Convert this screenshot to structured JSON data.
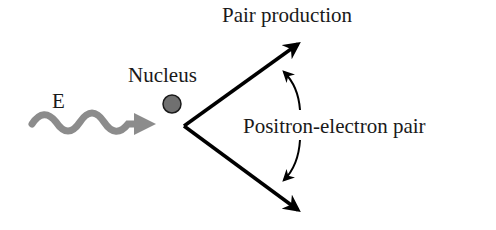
{
  "diagram": {
    "title": "Pair production",
    "labels": {
      "energy": "E",
      "nucleus": "Nucleus",
      "pair": "Positron-electron pair"
    },
    "colors": {
      "photon_wave": "#8c8c8c",
      "nucleus_fill": "#707070",
      "arrows": "#000000",
      "text": "#1a1a1a"
    }
  }
}
